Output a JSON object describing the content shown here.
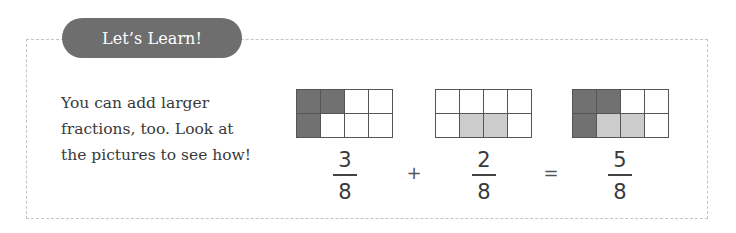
{
  "section": {
    "badge_label": "Let’s Learn!",
    "body_lines": [
      "You can add larger",
      "fractions, too. Look at",
      "the pictures to see how!"
    ]
  },
  "equation": {
    "terms": [
      {
        "numerator": "3",
        "denominator": "8",
        "grid_cells": [
          "dark",
          "dark",
          "white",
          "white",
          "dark",
          "white",
          "white",
          "white"
        ]
      },
      {
        "numerator": "2",
        "denominator": "8",
        "grid_cells": [
          "white",
          "white",
          "white",
          "white",
          "white",
          "light",
          "light",
          "white"
        ]
      },
      {
        "numerator": "5",
        "denominator": "8",
        "grid_cells": [
          "dark",
          "dark",
          "white",
          "white",
          "dark",
          "light",
          "light",
          "white"
        ]
      }
    ],
    "operators": [
      "+",
      "="
    ]
  },
  "colors": {
    "badge_bg": "#6e6e6e",
    "dark_fill": "#717171",
    "light_fill": "#cccccc",
    "grid_line": "#555555",
    "dashed_border": "#c4c4c4",
    "text": "#3a3a3a"
  }
}
